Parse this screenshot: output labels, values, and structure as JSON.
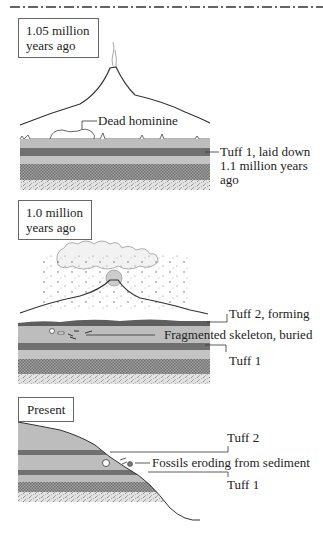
{
  "figure": {
    "type": "geological-time-sequence-diagram",
    "colors": {
      "sediment_light": "#bdbdbd",
      "tuff_dark": "#707070",
      "hatched_layer": "#8a8a8a",
      "speckled_layer": "#d6d6d6",
      "outline": "#333333"
    }
  },
  "panels": [
    {
      "id": "panel-1",
      "time_label_line1": "1.05 million",
      "time_label_line2": "years ago",
      "callouts": [
        {
          "text": "Dead hominine"
        },
        {
          "text_line1": "Tuff 1, laid down",
          "text_line2": "1.1 million years",
          "text_line3": "ago"
        }
      ]
    },
    {
      "id": "panel-2",
      "time_label_line1": "1.0 million",
      "time_label_line2": "years ago",
      "callouts": [
        {
          "text": "Tuff 2, forming"
        },
        {
          "text": "Fragmented skeleton, buried"
        },
        {
          "text": "Tuff 1"
        }
      ]
    },
    {
      "id": "panel-3",
      "time_label_line1": "Present",
      "callouts": [
        {
          "text": "Tuff 2"
        },
        {
          "text": "Fossils eroding from sediment"
        },
        {
          "text": "Tuff 1"
        }
      ]
    }
  ]
}
